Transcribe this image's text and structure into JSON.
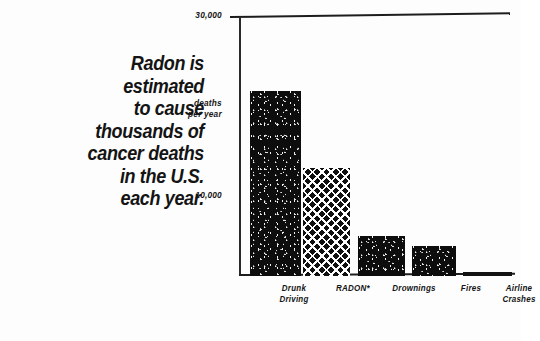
{
  "headline": {
    "lines": [
      "Radon is",
      "estimated",
      "to cause",
      "thousands of",
      "cancer deaths",
      "in the U.S.",
      "each year."
    ]
  },
  "axis": {
    "unit_line1": "deaths",
    "unit_line2": "per year",
    "tick_top": "30,000",
    "tick_mid": "10,000"
  },
  "colors": {
    "ink": "#111111",
    "paper": "#fdfdfd"
  },
  "chart_data": {
    "type": "bar",
    "title": "",
    "subtitle": "",
    "xlabel": "",
    "ylabel": "deaths per year",
    "ylim": [
      0,
      30000
    ],
    "grid": false,
    "legend": false,
    "yticks": [
      10000,
      30000
    ],
    "ytick_labels": [
      "10,000",
      "30,000"
    ],
    "categories": [
      "Drunk Driving",
      "RADON*",
      "Drownings",
      "Fires",
      "Airline Crashes"
    ],
    "values": [
      25000,
      14000,
      5000,
      3600,
      250
    ],
    "fills": [
      "speckle",
      "diamond",
      "speckle",
      "speckle",
      "solid"
    ],
    "annotations": [
      "* RADON bar is rendered with a cross-hatch pattern"
    ]
  },
  "categories": [
    {
      "line1": "Drunk",
      "line2": "Driving",
      "left": 22,
      "width": 64
    },
    {
      "line1": "RADON*",
      "line2": "",
      "left": 82,
      "width": 62
    },
    {
      "line1": "Drownings",
      "line2": "",
      "left": 138,
      "width": 72
    },
    {
      "line1": "Fires",
      "line2": "",
      "left": 204,
      "width": 54
    },
    {
      "line1": "Airline",
      "line2": "Crashes",
      "left": 246,
      "width": 66
    }
  ],
  "bars": [
    {
      "name": "drunk-driving",
      "left": 10,
      "width": 51,
      "height": 185,
      "fill": "fill-speckle"
    },
    {
      "name": "radon",
      "left": 63,
      "width": 47,
      "height": 108,
      "fill": "fill-diamond"
    },
    {
      "name": "drownings",
      "left": 118,
      "width": 47,
      "height": 40,
      "fill": "fill-speckle"
    },
    {
      "name": "fires",
      "left": 172,
      "width": 44,
      "height": 30,
      "fill": "fill-speckle"
    },
    {
      "name": "airline-crashes",
      "left": 223,
      "width": 49,
      "height": 4,
      "fill": "fill-solid"
    }
  ]
}
